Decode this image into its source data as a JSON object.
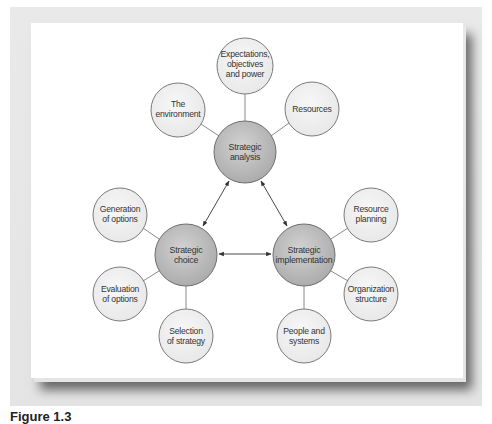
{
  "figure": {
    "caption": "Figure 1.3",
    "colors": {
      "frame": "#e6e6e6",
      "panel": "#ffffff",
      "main_fill": "#c2c2c2",
      "satellite_fill": "#f0f0f0",
      "stroke": "#7a7a7a",
      "connector": "#8a8a8a",
      "arrow": "#333333"
    }
  },
  "main_nodes": {
    "analysis": {
      "line1": "Strategic",
      "line2": "analysis"
    },
    "choice": {
      "line1": "Strategic",
      "line2": "choice"
    },
    "implementation": {
      "line1": "Strategic",
      "line2": "implementation"
    }
  },
  "satellites": {
    "environment": {
      "line1": "The",
      "line2": "environment"
    },
    "expectations": {
      "line1": "Expectations,",
      "line2": "objectives",
      "line3": "and power"
    },
    "resources": {
      "line1": "Resources"
    },
    "generation": {
      "line1": "Generation",
      "line2": "of options"
    },
    "evaluation": {
      "line1": "Evaluation",
      "line2": "of options"
    },
    "selection": {
      "line1": "Selection",
      "line2": "of strategy"
    },
    "resource_planning": {
      "line1": "Resource",
      "line2": "planning"
    },
    "organization": {
      "line1": "Organization",
      "line2": "structure"
    },
    "people": {
      "line1": "People and",
      "line2": "systems"
    }
  },
  "relations": [
    {
      "from": "Strategic analysis",
      "to": "Strategic choice",
      "type": "bidirectional"
    },
    {
      "from": "Strategic analysis",
      "to": "Strategic implementation",
      "type": "bidirectional"
    },
    {
      "from": "Strategic choice",
      "to": "Strategic implementation",
      "type": "bidirectional"
    }
  ]
}
